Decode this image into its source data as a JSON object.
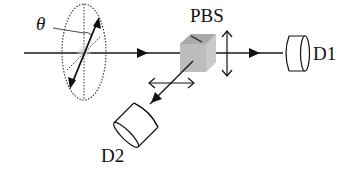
{
  "diagram": {
    "labels": {
      "theta": "θ",
      "pbs": "PBS",
      "detector1": "D1",
      "detector2": "D2"
    },
    "components": [
      {
        "id": "polarizer",
        "type": "polarization-ellipse",
        "label": "θ"
      },
      {
        "id": "pbs",
        "type": "polarizing-beam-splitter",
        "label": "PBS"
      },
      {
        "id": "d1",
        "type": "detector",
        "label": "D1"
      },
      {
        "id": "d2",
        "type": "detector",
        "label": "D2"
      }
    ],
    "colors": {
      "line": "#1a1a1a",
      "cube": "#bdbdbd",
      "spot": "#c8c8c8",
      "background": "#ffffff"
    }
  }
}
